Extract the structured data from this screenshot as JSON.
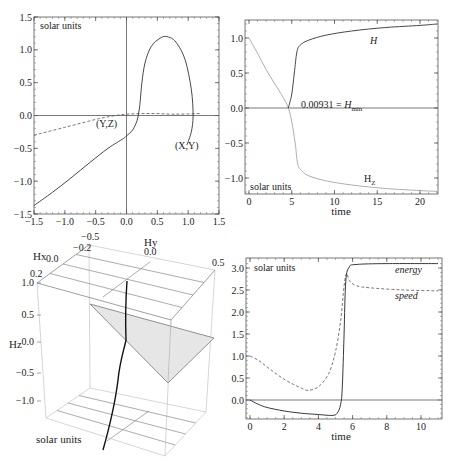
{
  "chart_data": [
    {
      "id": "trajectory",
      "type": "line",
      "title": "",
      "annotation": "solar units",
      "xlim": [
        -1.5,
        1.5
      ],
      "ylim": [
        -1.5,
        1.5
      ],
      "xticks": [
        "-1.5",
        "-1.0",
        "-0.5",
        "0.0",
        "0.5",
        "1.0",
        "1.5"
      ],
      "yticks": [
        "1.5",
        "1.0",
        "0.5",
        "0.0",
        "-0.5",
        "-1.0",
        "-1.5"
      ],
      "grid": false,
      "series": [
        {
          "name": "(X,Y)",
          "style": "solid",
          "points": [
            [
              -1.5,
              -1.37
            ],
            [
              -1.2,
              -1.17
            ],
            [
              -0.9,
              -0.95
            ],
            [
              -0.6,
              -0.72
            ],
            [
              -0.3,
              -0.5
            ],
            [
              -0.05,
              -0.35
            ],
            [
              0.0,
              -0.31
            ],
            [
              0.1,
              -0.22
            ],
            [
              0.17,
              -0.08
            ],
            [
              0.2,
              0.05
            ],
            [
              0.22,
              0.2
            ],
            [
              0.25,
              0.5
            ],
            [
              0.3,
              0.8
            ],
            [
              0.4,
              1.05
            ],
            [
              0.55,
              1.18
            ],
            [
              0.66,
              1.2
            ],
            [
              0.8,
              1.12
            ],
            [
              0.95,
              0.85
            ],
            [
              1.05,
              0.4
            ],
            [
              1.08,
              0.0
            ],
            [
              1.05,
              -0.25
            ],
            [
              0.98,
              -0.45
            ]
          ]
        },
        {
          "name": "(Y,Z)",
          "style": "dashed",
          "points": [
            [
              -1.5,
              -0.3
            ],
            [
              -1.0,
              -0.18
            ],
            [
              -0.5,
              -0.06
            ],
            [
              -0.3,
              -0.02
            ],
            [
              0.0,
              0.02
            ],
            [
              0.4,
              0.03
            ],
            [
              0.8,
              0.02
            ],
            [
              1.2,
              0.03
            ]
          ]
        }
      ],
      "labels": [
        {
          "text": "(Y,Z)",
          "x": -0.5,
          "y": -0.1
        },
        {
          "text": "(X,Y)",
          "x": 0.95,
          "y": -0.45
        }
      ]
    },
    {
      "id": "H-vs-time",
      "type": "line",
      "xlabel": "time",
      "annotation": "solar units",
      "xlim": [
        -0.5,
        22
      ],
      "ylim": [
        -1.25,
        1.25
      ],
      "xticks": [
        "0",
        "5",
        "10",
        "15",
        "20"
      ],
      "yticks": [
        "1.0",
        "0.5",
        "0.0",
        "-0.5",
        "-1.0"
      ],
      "series": [
        {
          "name": "H",
          "style": "solid-dark",
          "points": [
            [
              4.6,
              0.0
            ],
            [
              5.0,
              0.2
            ],
            [
              5.3,
              0.5
            ],
            [
              5.6,
              0.8
            ],
            [
              6.0,
              0.9
            ],
            [
              7,
              0.97
            ],
            [
              9,
              1.04
            ],
            [
              12,
              1.1
            ],
            [
              16,
              1.15
            ],
            [
              20,
              1.18
            ],
            [
              22,
              1.2
            ]
          ]
        },
        {
          "name": "Hz",
          "style": "solid-light",
          "points": [
            [
              0,
              1.0
            ],
            [
              1,
              0.78
            ],
            [
              2,
              0.55
            ],
            [
              3,
              0.35
            ],
            [
              4,
              0.15
            ],
            [
              4.6,
              0.0
            ],
            [
              5.0,
              -0.2
            ],
            [
              5.4,
              -0.5
            ],
            [
              5.7,
              -0.8
            ],
            [
              6.2,
              -0.9
            ],
            [
              7,
              -0.97
            ],
            [
              9,
              -1.04
            ],
            [
              12,
              -1.1
            ],
            [
              16,
              -1.15
            ],
            [
              20,
              -1.18
            ],
            [
              22,
              -1.19
            ]
          ]
        },
        {
          "name": "zero-line",
          "style": "solid",
          "points": [
            [
              -0.5,
              0
            ],
            [
              22,
              0
            ]
          ]
        }
      ],
      "labels": [
        {
          "text": "H",
          "italic": true,
          "x": 14.5,
          "y": 0.98
        },
        {
          "text": "0.00931 = H_min",
          "x": 6.5,
          "y": 0.03
        },
        {
          "text": "H_Z",
          "x": 13.8,
          "y": -1.05
        }
      ]
    },
    {
      "id": "H-3d",
      "type": "line3d",
      "annotation": "solar units",
      "axes": {
        "x": "Hx",
        "y": "Hy",
        "z": "Hz"
      },
      "xticks": [
        "-0.2",
        "0.0",
        "0.2"
      ],
      "yticks": [
        "-0.5",
        "0.0",
        "0.5"
      ],
      "zticks": [
        "1.0",
        "0.5",
        "0.0",
        "-0.5",
        "-1.0"
      ],
      "series": [
        {
          "name": "H trajectory",
          "style": "solid-thick"
        },
        {
          "name": "shaded triangle",
          "style": "filled-gray"
        }
      ]
    },
    {
      "id": "energy-speed",
      "type": "line",
      "xlabel": "time",
      "annotation": "solar units",
      "xlim": [
        -0.2,
        11.1
      ],
      "ylim": [
        -0.42,
        3.2
      ],
      "xticks": [
        "0",
        "2",
        "4",
        "6",
        "8",
        "10"
      ],
      "yticks": [
        "3.0",
        "2.5",
        "2.0",
        "1.5",
        "1.0",
        "0.5",
        "0.0"
      ],
      "series": [
        {
          "name": "energy",
          "style": "solid",
          "points": [
            [
              0,
              0.0
            ],
            [
              0.5,
              -0.1
            ],
            [
              1,
              -0.17
            ],
            [
              2,
              -0.25
            ],
            [
              3,
              -0.3
            ],
            [
              4,
              -0.33
            ],
            [
              4.8,
              -0.35
            ],
            [
              5.1,
              -0.3
            ],
            [
              5.3,
              -0.1
            ],
            [
              5.4,
              0.3
            ],
            [
              5.5,
              1.5
            ],
            [
              5.6,
              2.7
            ],
            [
              5.8,
              3.02
            ],
            [
              6.2,
              3.08
            ],
            [
              8,
              3.1
            ],
            [
              11,
              3.1
            ]
          ]
        },
        {
          "name": "speed",
          "style": "dashed",
          "points": [
            [
              0,
              1.0
            ],
            [
              0.5,
              0.9
            ],
            [
              1,
              0.75
            ],
            [
              2,
              0.47
            ],
            [
              3,
              0.27
            ],
            [
              3.4,
              0.22
            ],
            [
              4,
              0.3
            ],
            [
              4.6,
              0.6
            ],
            [
              5.0,
              1.1
            ],
            [
              5.3,
              1.8
            ],
            [
              5.5,
              2.6
            ],
            [
              5.65,
              2.88
            ],
            [
              5.8,
              2.72
            ],
            [
              6.2,
              2.6
            ],
            [
              7,
              2.55
            ],
            [
              9,
              2.5
            ],
            [
              11,
              2.48
            ]
          ]
        },
        {
          "name": "zero-line",
          "style": "solid",
          "points": [
            [
              -0.2,
              0
            ],
            [
              11.1,
              0
            ]
          ]
        }
      ],
      "labels": [
        {
          "text": "energy",
          "italic": true,
          "x": 8.3,
          "y": 2.88
        },
        {
          "text": "speed",
          "italic": true,
          "x": 8.3,
          "y": 2.3
        }
      ]
    }
  ],
  "text": {
    "solar_units": "solar units",
    "time": "time",
    "xy_label": "(X,Y)",
    "yz_label": "(Y,Z)",
    "H_label": "H",
    "Hmin_prefix": "0.00931 = ",
    "Hmin_H": "H",
    "Hmin_sub": "min",
    "Hz_H": "H",
    "Hz_sub": "Z",
    "energy": "energy",
    "speed": "speed",
    "Hx": "Hx",
    "Hy": "Hy",
    "Hz": "Hz"
  }
}
